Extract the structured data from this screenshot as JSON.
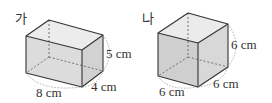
{
  "figures": [
    {
      "id": "ga",
      "title": "가",
      "shape": "rectangular-prism",
      "dimensions": {
        "length": "8 cm",
        "width": "4 cm",
        "height": "5 cm"
      }
    },
    {
      "id": "na",
      "title": "나",
      "shape": "cube",
      "dimensions": {
        "length": "6 cm",
        "width": "6 cm",
        "height": "6 cm"
      }
    }
  ],
  "colors": {
    "front_face": "#d9d9d9",
    "side_face": "#cfcfcf",
    "top_face": "#ebebeb",
    "edge": "#333333",
    "hidden_edge": "#555555",
    "dimension_arc": "#999999"
  }
}
